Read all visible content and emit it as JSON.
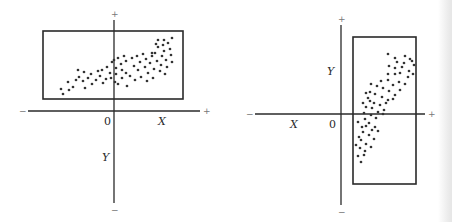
{
  "figure": {
    "colors": {
      "ink": "#2a2a2a",
      "dot": "#333333",
      "sign": "#777777"
    }
  },
  "chart_data": [
    {
      "type": "scatter",
      "title": "",
      "panel": "left",
      "axes": {
        "x_label": "X",
        "y_label": "Y",
        "origin_label": "0",
        "x_neg_sign": "−",
        "x_pos_sign": "+",
        "y_pos_sign": "+",
        "y_neg_sign": "−"
      },
      "xlim": [
        -86,
        86
      ],
      "ylim": [
        -92,
        91
      ],
      "grid": false,
      "enclosing_box": {
        "x": [
          -71,
          69
        ],
        "y": [
          12,
          80
        ]
      },
      "points": [
        [
          -51,
          17
        ],
        [
          -53,
          22
        ],
        [
          -45,
          21
        ],
        [
          -46,
          29
        ],
        [
          -41,
          24
        ],
        [
          -38,
          31
        ],
        [
          -35,
          34
        ],
        [
          -36,
          41
        ],
        [
          -30,
          39
        ],
        [
          -31,
          30
        ],
        [
          -26,
          33
        ],
        [
          -29,
          23
        ],
        [
          -23,
          37
        ],
        [
          -22,
          27
        ],
        [
          -18,
          31
        ],
        [
          -16,
          40
        ],
        [
          -14,
          35
        ],
        [
          -11,
          28
        ],
        [
          -12,
          41
        ],
        [
          -7,
          44
        ],
        [
          -4,
          38
        ],
        [
          -8,
          32
        ],
        [
          -3,
          33
        ],
        [
          -2,
          49
        ],
        [
          0,
          51
        ],
        [
          2,
          43
        ],
        [
          2,
          37
        ],
        [
          1,
          29
        ],
        [
          4,
          53
        ],
        [
          4,
          27
        ],
        [
          7,
          47
        ],
        [
          8,
          41
        ],
        [
          8,
          33
        ],
        [
          10,
          55
        ],
        [
          12,
          50
        ],
        [
          12,
          38
        ],
        [
          13,
          25
        ],
        [
          16,
          35
        ],
        [
          18,
          53
        ],
        [
          20,
          45
        ],
        [
          21,
          31
        ],
        [
          23,
          55
        ],
        [
          24,
          41
        ],
        [
          26,
          49
        ],
        [
          27,
          34
        ],
        [
          29,
          57
        ],
        [
          31,
          44
        ],
        [
          32,
          52
        ],
        [
          33,
          30
        ],
        [
          34,
          38
        ],
        [
          36,
          48
        ],
        [
          38,
          55
        ],
        [
          39,
          33
        ],
        [
          40,
          42
        ],
        [
          41,
          58
        ],
        [
          43,
          50
        ],
        [
          44,
          64
        ],
        [
          46,
          40
        ],
        [
          47,
          46
        ],
        [
          48,
          55
        ],
        [
          49,
          66
        ],
        [
          50,
          60
        ],
        [
          51,
          37
        ],
        [
          52,
          51
        ],
        [
          53,
          44
        ],
        [
          54,
          68
        ],
        [
          56,
          62
        ],
        [
          57,
          56
        ],
        [
          58,
          49
        ],
        [
          42,
          67
        ],
        [
          38,
          58
        ],
        [
          44,
          71
        ],
        [
          50,
          71
        ],
        [
          58,
          73
        ]
      ]
    },
    {
      "type": "scatter",
      "title": "",
      "panel": "right",
      "axes": {
        "x_label": "X",
        "y_label": "Y",
        "origin_label": "0",
        "x_neg_sign": "−",
        "x_pos_sign": "+",
        "y_pos_sign": "+",
        "y_neg_sign": "−"
      },
      "xlim": [
        -86,
        84
      ],
      "ylim": [
        -91,
        89
      ],
      "grid": false,
      "enclosing_box": {
        "x": [
          12,
          75
        ],
        "y": [
          -70,
          77
        ]
      },
      "points": [
        [
          47,
          60
        ],
        [
          54,
          56
        ],
        [
          64,
          58
        ],
        [
          69,
          55
        ],
        [
          56,
          52
        ],
        [
          63,
          51
        ],
        [
          71,
          53
        ],
        [
          48,
          48
        ],
        [
          54,
          46
        ],
        [
          61,
          47
        ],
        [
          68,
          43
        ],
        [
          73,
          49
        ],
        [
          47,
          40
        ],
        [
          54,
          40
        ],
        [
          59,
          41
        ],
        [
          67,
          37
        ],
        [
          72,
          40
        ],
        [
          40,
          33
        ],
        [
          47,
          34
        ],
        [
          52,
          29
        ],
        [
          58,
          32
        ],
        [
          64,
          30
        ],
        [
          30,
          30
        ],
        [
          36,
          28
        ],
        [
          42,
          26
        ],
        [
          48,
          23
        ],
        [
          54,
          19
        ],
        [
          59,
          24
        ],
        [
          29,
          22
        ],
        [
          34,
          20
        ],
        [
          41,
          17
        ],
        [
          47,
          14
        ],
        [
          52,
          15
        ],
        [
          27,
          16
        ],
        [
          33,
          11
        ],
        [
          39,
          9
        ],
        [
          45,
          11
        ],
        [
          25,
          7
        ],
        [
          31,
          6
        ],
        [
          37,
          2
        ],
        [
          43,
          4
        ],
        [
          23,
          1
        ],
        [
          30,
          -1
        ],
        [
          35,
          -4
        ],
        [
          42,
          0
        ],
        [
          24,
          -5
        ],
        [
          28,
          -9
        ],
        [
          34,
          -13
        ],
        [
          25,
          -12
        ],
        [
          31,
          -16
        ],
        [
          37,
          -17
        ],
        [
          22,
          -18
        ],
        [
          28,
          -21
        ],
        [
          33,
          -25
        ],
        [
          20,
          -26
        ],
        [
          25,
          -30
        ],
        [
          30,
          -33
        ],
        [
          19,
          -34
        ],
        [
          24,
          -37
        ],
        [
          17,
          -42
        ],
        [
          23,
          -41
        ],
        [
          20,
          -48
        ],
        [
          15,
          -31
        ],
        [
          18,
          -23
        ],
        [
          21,
          -13
        ],
        [
          17,
          -8
        ],
        [
          22,
          11
        ],
        [
          25,
          21
        ],
        [
          29,
          13
        ]
      ]
    }
  ]
}
